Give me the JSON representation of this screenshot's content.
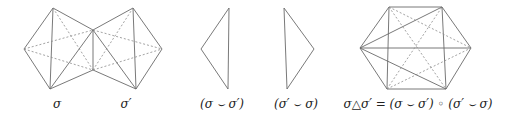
{
  "labels": {
    "sigma": "σ",
    "sigma_prime": "σ′",
    "diff1": "(σ ⌣ σ′)",
    "diff2": "(σ′ ⌣ σ)",
    "symdiff": "σ△σ′ = (σ ⌣ σ′) ◦ (σ′ ⌣ σ)"
  },
  "figures": [
    {
      "name": "sigma",
      "vertices": [
        [
          24,
          49
        ],
        [
          53,
          8
        ],
        [
          93,
          30
        ],
        [
          93,
          70
        ],
        [
          50,
          89
        ]
      ]
    },
    {
      "name": "sigma-prime",
      "vertices": [
        [
          93,
          30
        ],
        [
          133,
          8
        ],
        [
          162,
          49
        ],
        [
          136,
          89
        ],
        [
          93,
          70
        ]
      ]
    },
    {
      "name": "sigma-minus-sigma-prime",
      "vertices": [
        [
          229,
          8
        ],
        [
          201,
          49
        ],
        [
          228,
          89
        ]
      ]
    },
    {
      "name": "sigma-prime-minus-sigma",
      "vertices": [
        [
          284,
          8
        ],
        [
          314,
          49
        ],
        [
          287,
          89
        ]
      ]
    },
    {
      "name": "symmetric-difference",
      "vertices": [
        [
          389,
          7
        ],
        [
          442,
          7
        ],
        [
          471,
          48
        ],
        [
          446,
          89
        ],
        [
          387,
          89
        ],
        [
          360,
          48
        ]
      ]
    }
  ]
}
